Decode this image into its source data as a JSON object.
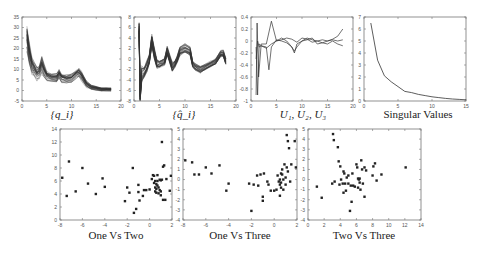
{
  "figure": {
    "captions": {
      "q": "{q_i}",
      "qhat": "{q̂_i}",
      "u": "U₁, U₂, U₃",
      "sv": "Singular Values",
      "one_two": "One Vs Two",
      "one_three": "One Vs Three",
      "two_three": "Two Vs Three"
    }
  },
  "chart_data": [
    {
      "id": "q",
      "type": "line",
      "title": "{q_i}",
      "xlabel": "",
      "ylabel": "",
      "xlim": [
        0,
        20
      ],
      "ylim": [
        -5,
        35
      ],
      "xticks": [
        0,
        5,
        10,
        15,
        20
      ],
      "yticks": [
        -5,
        0,
        5,
        10,
        15,
        20,
        25,
        30,
        35
      ],
      "grid": false,
      "description": "Many overlapping curves (ensemble)",
      "mean_curve": {
        "x": [
          1,
          1.5,
          2,
          2.5,
          3,
          3.5,
          4,
          4.5,
          5,
          6,
          7,
          7.5,
          8,
          9,
          10,
          11,
          11.5,
          12,
          13,
          14,
          15,
          16,
          17,
          18
        ],
        "y": [
          25,
          17,
          12,
          10,
          8,
          9,
          12,
          9,
          7,
          6,
          6,
          8,
          6,
          5.5,
          6,
          8,
          8.5,
          7,
          3,
          1.5,
          1,
          0.5,
          0.5,
          0.5
        ]
      },
      "spread": [
        6,
        5,
        4,
        3,
        3,
        3,
        4,
        3,
        2,
        2,
        2,
        2,
        2,
        2,
        2,
        2,
        2,
        2,
        1.5,
        1,
        1,
        0.8,
        0.8,
        0.8
      ],
      "n_curves": 30
    },
    {
      "id": "qhat",
      "type": "line",
      "title": "{q̂_i}",
      "xlim": [
        0,
        20
      ],
      "ylim": [
        -8,
        8
      ],
      "xticks": [
        0,
        5,
        10,
        15,
        20
      ],
      "yticks": [
        -8,
        -6,
        -4,
        -2,
        0,
        2,
        4,
        6,
        8
      ],
      "grid": false,
      "description": "Many overlapping normalized curves",
      "mean_curve": {
        "x": [
          1,
          1.2,
          1.5,
          2,
          2.5,
          3,
          3.5,
          4,
          4.5,
          5,
          6,
          6.5,
          7,
          7.5,
          8,
          8.5,
          9,
          10,
          11,
          11.5,
          12,
          13,
          14,
          15,
          16,
          17,
          17.5,
          18
        ],
        "y": [
          6,
          -7,
          -3,
          -2.5,
          -1.5,
          0,
          3.5,
          1,
          -1,
          -1,
          -0.5,
          1.5,
          0,
          -1.5,
          -1,
          0,
          1.5,
          2,
          1.5,
          -1,
          -1.5,
          -2,
          -1.5,
          -1,
          -0.5,
          1,
          1,
          -0.5
        ]
      },
      "spread": [
        1,
        1,
        1.5,
        1,
        1,
        1,
        1,
        1,
        0.8,
        0.6,
        0.6,
        0.8,
        0.8,
        0.8,
        0.6,
        0.6,
        0.8,
        0.8,
        0.8,
        0.6,
        0.6,
        0.6,
        0.6,
        0.5,
        0.5,
        0.6,
        0.6,
        0.6
      ],
      "n_curves": 30
    },
    {
      "id": "u",
      "type": "line",
      "title": "U₁, U₂, U₃",
      "xlim": [
        0,
        20
      ],
      "ylim": [
        -1,
        0.4
      ],
      "xticks": [
        0,
        5,
        10,
        15,
        20
      ],
      "yticks": [
        -1,
        -0.8,
        -0.6,
        -0.4,
        -0.2,
        0,
        0.2,
        0.4
      ],
      "series": [
        {
          "name": "U1",
          "x": [
            1,
            1.2,
            1.5,
            2,
            3,
            4,
            5,
            6,
            7,
            8,
            9,
            10,
            11,
            12,
            13,
            14,
            15,
            16,
            17,
            18
          ],
          "y": [
            -0.9,
            0.3,
            -0.6,
            -0.05,
            -0.05,
            0.33,
            0.0,
            0.02,
            0.05,
            0.03,
            -0.02,
            0.05,
            0.03,
            -0.02,
            0.0,
            0.02,
            0.0,
            0.03,
            0.08,
            0.2
          ]
        },
        {
          "name": "U2",
          "x": [
            1,
            1.3,
            1.6,
            2,
            3,
            3.5,
            4,
            5,
            6,
            7,
            8,
            8.5,
            9,
            10,
            11,
            12,
            13,
            14,
            15,
            16,
            17,
            18
          ],
          "y": [
            -0.3,
            0.0,
            -0.1,
            -0.08,
            -0.1,
            -0.48,
            -0.1,
            0.02,
            0.0,
            -0.03,
            -0.1,
            -0.2,
            -0.05,
            0.0,
            0.05,
            0.02,
            0.0,
            -0.03,
            0.0,
            0.02,
            0.0,
            0.02
          ]
        },
        {
          "name": "U3",
          "x": [
            1,
            1.3,
            1.6,
            2,
            3,
            4,
            5,
            6,
            7,
            8,
            8.5,
            9,
            10,
            11,
            12,
            13,
            14,
            15,
            16,
            17,
            18
          ],
          "y": [
            -0.1,
            -0.9,
            -0.05,
            -0.08,
            -0.12,
            -0.05,
            0.0,
            0.05,
            0.0,
            -0.1,
            -0.17,
            -0.1,
            0.0,
            0.02,
            0.05,
            -0.05,
            -0.03,
            -0.05,
            0.0,
            -0.05,
            -0.08
          ]
        }
      ]
    },
    {
      "id": "sv",
      "type": "line",
      "title": "Singular Values",
      "xlim": [
        0,
        15
      ],
      "ylim": [
        0,
        7
      ],
      "xticks": [
        0,
        5,
        10,
        15
      ],
      "yticks": [
        0,
        1,
        2,
        3,
        4,
        5,
        6,
        7
      ],
      "x": [
        1,
        2,
        3,
        4,
        5,
        6,
        7,
        8,
        9,
        10,
        11,
        12,
        13,
        14,
        15
      ],
      "y": [
        6.5,
        3.4,
        2.1,
        1.6,
        1.2,
        0.8,
        0.7,
        0.55,
        0.45,
        0.35,
        0.28,
        0.22,
        0.17,
        0.13,
        0.1
      ]
    },
    {
      "id": "one_two",
      "type": "scatter",
      "title": "One Vs Two",
      "xlim": [
        -8,
        2
      ],
      "ylim": [
        0,
        14
      ],
      "xticks": [
        -8,
        -6,
        -4,
        -2,
        0,
        2
      ],
      "yticks": [
        0,
        2,
        4,
        6,
        8,
        10,
        12,
        14
      ],
      "x": [
        -7.8,
        -7.2,
        -7.4,
        -6.6,
        -6,
        -5.5,
        -4.8,
        -4.2,
        -4,
        -2.2,
        -2,
        -1.8,
        -1.5,
        -1.4,
        -1.2,
        -1,
        -1,
        -0.9,
        -0.6,
        -0.5,
        -0.3,
        0,
        0.2,
        0.3,
        0.4,
        0.5,
        0.5,
        0.5,
        0.6,
        0.6,
        0.6,
        0.7,
        0.7,
        0.8,
        0.8,
        0.9,
        1,
        1,
        1.1,
        1.1,
        1.2,
        1.2,
        1.3,
        1.4,
        1.5,
        1.8,
        1.9,
        0.4,
        0.7,
        0.9,
        1.0
      ],
      "y": [
        6.5,
        9,
        3.7,
        4.4,
        8,
        5.6,
        4,
        6.4,
        5.1,
        2.9,
        5,
        4.2,
        8,
        1.1,
        1.7,
        5.4,
        4.3,
        3,
        3.7,
        4.6,
        4.6,
        4.7,
        6.3,
        6.9,
        6.8,
        6,
        5,
        4.4,
        5.5,
        4.2,
        4.8,
        6,
        6.9,
        5,
        4.1,
        6.2,
        6.1,
        4.4,
        12,
        6.2,
        3.1,
        8.2,
        8.4,
        3.1,
        6.3,
        4.5,
        6.8,
        5.7,
        5.3,
        4.6,
        3.8
      ]
    },
    {
      "id": "one_three",
      "type": "scatter",
      "title": "One Vs Three",
      "xlim": [
        -8,
        2
      ],
      "ylim": [
        -4,
        5
      ],
      "xticks": [
        -8,
        -6,
        -4,
        -2,
        0,
        2
      ],
      "yticks": [
        -4,
        -3,
        -2,
        -1,
        0,
        1,
        2,
        3,
        4,
        5
      ],
      "x": [
        -7.8,
        -7.2,
        -7,
        -6.6,
        -6,
        -5.5,
        -4.8,
        -4.2,
        -4,
        -2.2,
        -2,
        -1.8,
        -1.5,
        -1.4,
        -1.2,
        -1,
        -1,
        -0.9,
        -0.6,
        -0.5,
        -0.3,
        0,
        0.2,
        0.3,
        0.4,
        0.5,
        0.5,
        0.5,
        0.6,
        0.6,
        0.6,
        0.7,
        0.7,
        0.8,
        0.8,
        0.9,
        1,
        1,
        1.1,
        1.1,
        1.2,
        1.2,
        1.3,
        1.4,
        1.5,
        1.8,
        1.9
      ],
      "y": [
        1.9,
        1.7,
        0.5,
        0.5,
        1.2,
        0.6,
        1.4,
        -1.1,
        -0.4,
        -0.4,
        -3.1,
        -0.5,
        0.4,
        -0.6,
        0.5,
        -1.7,
        -2.1,
        0.6,
        -0.2,
        -0.5,
        -1.1,
        -1.1,
        -1,
        0.4,
        -0.2,
        -1.6,
        -0.5,
        0,
        0.6,
        -0.8,
        -0.3,
        0.5,
        1,
        0,
        -1,
        1.5,
        0.2,
        -0.5,
        1.2,
        4.4,
        3.8,
        0.8,
        3.1,
        -0.2,
        1.5,
        3.8,
        1.2
      ]
    },
    {
      "id": "two_three",
      "type": "scatter",
      "title": "Two Vs Three",
      "xlim": [
        0,
        14
      ],
      "ylim": [
        -4,
        5
      ],
      "xticks": [
        0,
        2,
        4,
        6,
        8,
        10,
        12,
        14
      ],
      "yticks": [
        -4,
        -3,
        -2,
        -1,
        0,
        1,
        2,
        3,
        4,
        5
      ],
      "x": [
        1.1,
        1.7,
        3,
        3.1,
        3.2,
        3.3,
        3.7,
        3.8,
        3.9,
        4,
        4.1,
        4.3,
        4.4,
        4.4,
        4.5,
        4.6,
        4.7,
        4.8,
        5,
        5,
        5.2,
        5.3,
        5.4,
        5.5,
        5.6,
        5.8,
        6,
        6.1,
        6.2,
        6.2,
        6.3,
        6.4,
        6.4,
        6.5,
        6.6,
        6.7,
        6.8,
        7,
        7,
        7.2,
        8,
        8.1,
        8.3,
        8.5,
        9.1,
        12.1
      ],
      "y": [
        -0.7,
        -1.8,
        -0.4,
        4.5,
        3.9,
        -0.2,
        3.2,
        1.8,
        -0.5,
        1.3,
        0,
        -0.4,
        0.8,
        -1.3,
        0.6,
        -0.4,
        -1.1,
        0.2,
        0.4,
        -0.4,
        -3.1,
        -0.6,
        -2.2,
        0.6,
        -0.6,
        -0.7,
        1.5,
        1.2,
        0.1,
        -0.8,
        0,
        -0.3,
        0.1,
        -1,
        1.9,
        1,
        -0.4,
        1.2,
        -1.7,
        0.9,
        0.4,
        1.3,
        1.6,
        -0.1,
        0.5,
        1.2
      ]
    }
  ]
}
